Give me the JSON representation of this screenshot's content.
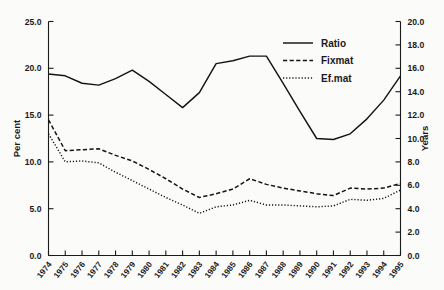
{
  "chart_data": {
    "type": "line",
    "title": "",
    "xlabel": "",
    "ylabel": "Per cent",
    "ylabel_right": "Years",
    "grid": false,
    "legend_position": "top-right",
    "categories": [
      "1974",
      "1975",
      "1976",
      "1977",
      "1978",
      "1979",
      "1980",
      "1981",
      "1982",
      "1983",
      "1984",
      "1985",
      "1986",
      "1987",
      "1988",
      "1989",
      "1990",
      "1991",
      "1992",
      "1993",
      "1994",
      "1995"
    ],
    "ylim": [
      0.0,
      25.0
    ],
    "yticks": [
      "0.0",
      "5.0",
      "10.0",
      "15.0",
      "20.0",
      "25.0"
    ],
    "ytick_values": [
      0.0,
      5.0,
      10.0,
      15.0,
      20.0,
      25.0
    ],
    "ylim_right": [
      0.0,
      20.0
    ],
    "yticks_right": [
      "0.0",
      "2.0",
      "4.0",
      "6.0",
      "8.0",
      "10.0",
      "12.0",
      "14.0",
      "16.0",
      "18.0",
      "20.0"
    ],
    "ytick_values_right": [
      0.0,
      2.0,
      4.0,
      6.0,
      8.0,
      10.0,
      12.0,
      14.0,
      16.0,
      18.0,
      20.0
    ],
    "series": [
      {
        "name": "Ratio",
        "axis": "left",
        "style": "solid",
        "values": [
          19.4,
          19.2,
          18.4,
          18.2,
          18.9,
          19.8,
          18.6,
          17.2,
          15.8,
          17.4,
          20.5,
          20.8,
          21.3,
          21.3,
          18.4,
          15.4,
          12.5,
          12.4,
          13.0,
          14.6,
          16.6,
          19.2
        ]
      },
      {
        "name": "Fixmat",
        "axis": "left",
        "style": "dashed",
        "values": [
          14.5,
          11.2,
          11.3,
          11.4,
          10.7,
          10.1,
          9.2,
          8.2,
          7.1,
          6.2,
          6.6,
          7.1,
          8.2,
          7.6,
          7.2,
          6.9,
          6.6,
          6.4,
          7.2,
          7.1,
          7.2,
          7.7
        ]
      },
      {
        "name": "Ef.mat",
        "axis": "left",
        "style": "dotted",
        "values": [
          13.0,
          10.0,
          10.1,
          9.9,
          8.9,
          8.0,
          7.1,
          6.2,
          5.4,
          4.5,
          5.2,
          5.4,
          5.9,
          5.4,
          5.4,
          5.3,
          5.2,
          5.3,
          6.0,
          5.9,
          6.1,
          7.0
        ]
      }
    ],
    "legend": [
      {
        "label": "Ratio",
        "style": "solid"
      },
      {
        "label": "Fixmat",
        "style": "dashed"
      },
      {
        "label": "Ef.mat",
        "style": "dotted"
      }
    ],
    "colors": {
      "line": "#141414",
      "axis": "#1a1a1a",
      "background": "#fbfbfa"
    }
  }
}
